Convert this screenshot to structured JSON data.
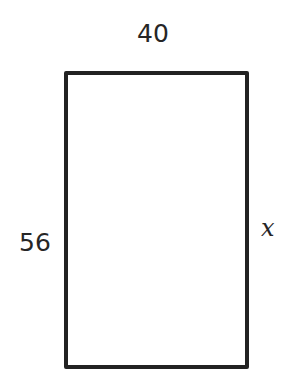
{
  "diagram": {
    "shape": "rectangle",
    "labels": {
      "top": "40",
      "left": "56",
      "right": "x"
    },
    "stroke_color": "#222222",
    "fill_color": "#ffffff"
  }
}
